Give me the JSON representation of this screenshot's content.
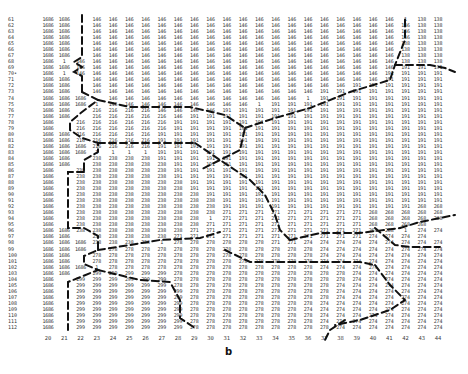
{
  "figure": {
    "panel_label": "b",
    "row_start": 61,
    "row_labels": [
      "61",
      "62",
      "63",
      "64",
      "65",
      "66",
      "67",
      "68",
      "69",
      "70•",
      "71",
      "72",
      "73",
      "74",
      "75",
      "76",
      "77",
      "78",
      "79",
      "80",
      "81",
      "82",
      "83",
      "84",
      "85",
      "86",
      "87",
      "88",
      "89",
      "90",
      "91",
      "92",
      "93",
      "94",
      "95",
      "96",
      "97",
      "98",
      "99",
      "100",
      "101",
      "102",
      "103",
      "104",
      "105",
      "106",
      "107",
      "108",
      "109",
      "110",
      "111",
      "112"
    ],
    "col_labels": [
      "20",
      "21",
      "22",
      "23",
      "24",
      "25",
      "26",
      "27",
      "28",
      "29",
      "30",
      "31",
      "32",
      "33",
      "34",
      "35",
      "36",
      "37",
      "38",
      "39",
      "40",
      "41",
      "42",
      "43",
      "44"
    ],
    "grid_rows": [
      [
        [
          "1686",
          2
        ],
        [
          "",
          1
        ],
        [
          "146",
          19
        ],
        [
          "1",
          1
        ],
        [
          "138",
          2
        ]
      ],
      [
        [
          "1686",
          2
        ],
        [
          "",
          1
        ],
        [
          "146",
          20
        ],
        [
          "138",
          2
        ]
      ],
      [
        [
          "1686",
          2
        ],
        [
          "",
          1
        ],
        [
          "146",
          20
        ],
        [
          "138",
          2
        ]
      ],
      [
        [
          "1686",
          2
        ],
        [
          "",
          1
        ],
        [
          "146",
          20
        ],
        [
          "138",
          2
        ]
      ],
      [
        [
          "1686",
          2
        ],
        [
          "",
          1
        ],
        [
          "146",
          19
        ],
        [
          "138",
          3
        ]
      ],
      [
        [
          "1686",
          2
        ],
        [
          "",
          1
        ],
        [
          "146",
          19
        ],
        [
          "138",
          3
        ]
      ],
      [
        [
          "1686",
          2
        ],
        [
          "",
          1
        ],
        [
          "146",
          19
        ],
        [
          "138",
          3
        ]
      ],
      [
        [
          "1686",
          1
        ],
        [
          "1",
          1
        ],
        [
          "146",
          20
        ],
        [
          "138",
          3
        ]
      ],
      [
        [
          "1686",
          2
        ],
        [
          "146",
          20
        ],
        [
          "191",
          3
        ]
      ],
      [
        [
          "1686",
          1
        ],
        [
          "1",
          1
        ],
        [
          "146",
          19
        ],
        [
          "191",
          4
        ]
      ],
      [
        [
          "1686",
          2
        ],
        [
          "",
          1
        ],
        [
          "146",
          18
        ],
        [
          "191",
          4
        ]
      ],
      [
        [
          "1686",
          2
        ],
        [
          "",
          1
        ],
        [
          "146",
          16
        ],
        [
          "191",
          6
        ]
      ],
      [
        [
          "1686",
          2
        ],
        [
          "",
          1
        ],
        [
          "146",
          14
        ],
        [
          "191",
          8
        ]
      ],
      [
        [
          "1686",
          3
        ],
        [
          "",
          1
        ],
        [
          "146",
          12
        ],
        [
          "1",
          1
        ],
        [
          "191",
          8
        ]
      ],
      [
        [
          "1686",
          3
        ],
        [
          "1",
          1
        ],
        [
          "146",
          9
        ],
        [
          "1",
          1
        ],
        [
          "191",
          11
        ]
      ],
      [
        [
          "1686",
          2
        ],
        [
          "",
          1
        ],
        [
          "216",
          4
        ],
        [
          "146",
          4
        ],
        [
          "191",
          14
        ]
      ],
      [
        [
          "1686",
          2
        ],
        [
          "",
          1
        ],
        [
          "216",
          5
        ],
        [
          "146",
          1
        ],
        [
          "191",
          16
        ]
      ],
      [
        [
          "1686",
          1
        ],
        [
          "",
          1
        ],
        [
          "216",
          6
        ],
        [
          "191",
          17
        ]
      ],
      [
        [
          "1686",
          1
        ],
        [
          "",
          1
        ],
        [
          "216",
          6
        ],
        [
          "191",
          17
        ]
      ],
      [
        [
          "1686",
          2
        ],
        [
          "216",
          5
        ],
        [
          "191",
          18
        ]
      ],
      [
        [
          "1686",
          2
        ],
        [
          "216",
          5
        ],
        [
          "191",
          18
        ]
      ],
      [
        [
          "1686",
          3
        ],
        [
          "216",
          4
        ],
        [
          "191",
          18
        ]
      ],
      [
        [
          "1686",
          3
        ],
        [
          "1",
          4
        ],
        [
          "191",
          18
        ]
      ],
      [
        [
          "1686",
          2
        ],
        [
          "",
          1
        ],
        [
          "238",
          4
        ],
        [
          "191",
          18
        ]
      ],
      [
        [
          "1686",
          2
        ],
        [
          "",
          1
        ],
        [
          "238",
          5
        ],
        [
          "191",
          17
        ]
      ],
      [
        [
          "1686",
          1
        ],
        [
          "",
          1
        ],
        [
          "238",
          6
        ],
        [
          "191",
          17
        ]
      ],
      [
        [
          "1686",
          1
        ],
        [
          "",
          1
        ],
        [
          "238",
          6
        ],
        [
          "191",
          17
        ]
      ],
      [
        [
          "1686",
          1
        ],
        [
          "",
          1
        ],
        [
          "238",
          7
        ],
        [
          "191",
          16
        ]
      ],
      [
        [
          "1686",
          1
        ],
        [
          "",
          1
        ],
        [
          "238",
          7
        ],
        [
          "191",
          16
        ]
      ],
      [
        [
          "1686",
          1
        ],
        [
          "",
          1
        ],
        [
          "238",
          8
        ],
        [
          "191",
          15
        ]
      ],
      [
        [
          "1686",
          1
        ],
        [
          "",
          1
        ],
        [
          "238",
          9
        ],
        [
          "191",
          14
        ]
      ],
      [
        [
          "1686",
          1
        ],
        [
          "",
          1
        ],
        [
          "238",
          9
        ],
        [
          "191",
          12
        ],
        [
          "268",
          2
        ]
      ],
      [
        [
          "1686",
          1
        ],
        [
          "",
          1
        ],
        [
          "238",
          9
        ],
        [
          "271",
          9
        ],
        [
          "268",
          5
        ]
      ],
      [
        [
          "1686",
          1
        ],
        [
          "",
          1
        ],
        [
          "238",
          8
        ],
        [
          "1",
          1
        ],
        [
          "271",
          9
        ],
        [
          "268",
          5
        ]
      ],
      [
        [
          "1686",
          1
        ],
        [
          "",
          1
        ],
        [
          "238",
          8
        ],
        [
          "271",
          10
        ],
        [
          "268",
          4
        ]
      ],
      [
        [
          "1686",
          2
        ],
        [
          "238",
          7
        ],
        [
          "271",
          11
        ],
        [
          "268",
          2
        ],
        [
          "1",
          1
        ],
        [
          "274",
          2
        ]
      ],
      [
        [
          "1686",
          2
        ],
        [
          "",
          1
        ],
        [
          "238",
          5
        ],
        [
          "271",
          12
        ],
        [
          "274",
          4
        ]
      ],
      [
        [
          "1686",
          3
        ],
        [
          "238",
          4
        ],
        [
          "1",
          1
        ],
        [
          "278",
          6
        ],
        [
          "271",
          2
        ],
        [
          "274",
          9
        ]
      ],
      [
        [
          "1686",
          3
        ],
        [
          "",
          1
        ],
        [
          "278",
          13
        ],
        [
          "274",
          8
        ]
      ],
      [
        [
          "1686",
          2
        ],
        [
          "",
          1
        ],
        [
          "278",
          14
        ],
        [
          "274",
          8
        ]
      ],
      [
        [
          "1686",
          2
        ],
        [
          "",
          1
        ],
        [
          "278",
          14
        ],
        [
          "274",
          8
        ]
      ],
      [
        [
          "1686",
          3
        ],
        [
          "1",
          1
        ],
        [
          "278",
          13
        ],
        [
          "274",
          8
        ]
      ],
      [
        [
          "1686",
          2
        ],
        [
          "",
          1
        ],
        [
          "299",
          5
        ],
        [
          "278",
          11
        ],
        [
          "274",
          6
        ]
      ],
      [
        [
          "1686",
          1
        ],
        [
          "",
          1
        ],
        [
          "299",
          6
        ],
        [
          "278",
          11
        ],
        [
          "274",
          6
        ]
      ],
      [
        [
          "1686",
          1
        ],
        [
          "",
          1
        ],
        [
          "299",
          6
        ],
        [
          "278",
          10
        ],
        [
          "274",
          7
        ]
      ],
      [
        [
          "1686",
          1
        ],
        [
          "",
          1
        ],
        [
          "299",
          7
        ],
        [
          "278",
          9
        ],
        [
          "274",
          7
        ]
      ],
      [
        [
          "1686",
          1
        ],
        [
          "",
          1
        ],
        [
          "299",
          7
        ],
        [
          "278",
          9
        ],
        [
          "274",
          7
        ]
      ],
      [
        [
          "1686",
          1
        ],
        [
          "",
          1
        ],
        [
          "299",
          7
        ],
        [
          "278",
          8
        ],
        [
          "274",
          8
        ]
      ],
      [
        [
          "1686",
          1
        ],
        [
          "",
          1
        ],
        [
          "299",
          7
        ],
        [
          "278",
          7
        ],
        [
          "274",
          9
        ]
      ],
      [
        [
          "1686",
          1
        ],
        [
          "",
          1
        ],
        [
          "299",
          7
        ],
        [
          "278",
          8
        ],
        [
          "274",
          8
        ]
      ],
      [
        [
          "1686",
          1
        ],
        [
          "",
          1
        ],
        [
          "299",
          7
        ],
        [
          "278",
          8
        ],
        [
          "274",
          8
        ]
      ],
      [
        [
          "1686",
          1
        ],
        [
          "",
          1
        ],
        [
          "299",
          7
        ],
        [
          "278",
          9
        ],
        [
          "274",
          7
        ]
      ]
    ],
    "boundary_color": "#111111",
    "text_color": "#333333"
  },
  "chart_data": {
    "type": "table",
    "title": "",
    "panel": "b",
    "ylabel": "row index (61–112)",
    "xlabel": "column index (20–44)",
    "region_values": [
      "1686",
      "146",
      "138",
      "216",
      "191",
      "238",
      "271",
      "268",
      "278",
      "274",
      "299"
    ]
  }
}
